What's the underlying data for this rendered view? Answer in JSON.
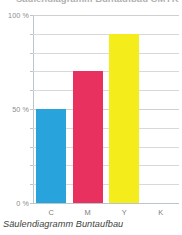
{
  "figure": {
    "title_partial": "Säulendiagramm Buntaufbau CMYK",
    "caption": "Säulendiagramm Buntaufbau"
  },
  "chart_data": {
    "type": "bar",
    "title": "Säulendiagramm Buntaufbau",
    "xlabel": "",
    "ylabel": "",
    "categories": [
      "C",
      "M",
      "Y",
      "K"
    ],
    "values": [
      50,
      70,
      90,
      0
    ],
    "series": [
      {
        "name": "Buntaufbau",
        "values": [
          50,
          70,
          90,
          0
        ]
      }
    ],
    "bar_colors": [
      "#29A3DC",
      "#E8315F",
      "#F5EC1C",
      "#1A1A18"
    ],
    "ylim": [
      0,
      100
    ],
    "ytick_values": [
      0,
      10,
      20,
      30,
      40,
      50,
      60,
      70,
      80,
      90,
      100
    ],
    "ytick_labels_shown": [
      {
        "value": 100,
        "label": "100 %"
      },
      {
        "value": 50,
        "label": "50 %"
      },
      {
        "value": 0,
        "label": "0 %"
      }
    ],
    "unit": "%",
    "grid": true,
    "grid_axis": "y",
    "legend": false,
    "legend_position": "none",
    "annotations": []
  },
  "colors": {
    "cyan": "#29A3DC",
    "magenta": "#E8315F",
    "yellow": "#F5EC1C",
    "black": "#1A1A18",
    "grid": "#d8d9da",
    "axis": "#b9c6cd",
    "tick_text": "#8a8b8c",
    "caption_text": "#3f3f41"
  }
}
